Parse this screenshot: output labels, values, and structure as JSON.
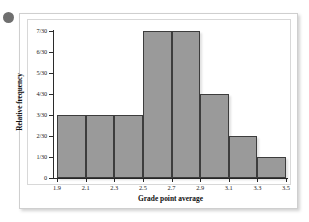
{
  "figure": {
    "bullet_marker": "bullet-dot",
    "frame_color": "#cfcfcf",
    "background_color": "#ffffff"
  },
  "chart_data": {
    "type": "bar",
    "title": "",
    "subtitle": "",
    "xlabel": "Grade point average",
    "ylabel": "Relative frequency",
    "grid": false,
    "legend": "none",
    "bar_fill_color": "#9a9a9a",
    "bar_border_color": "#3d3d3d",
    "axis_color": "#2b2b2b",
    "x_tick_labels": [
      "1.9",
      "2.1",
      "2.3",
      "2.5",
      "2.7",
      "2.9",
      "3.1",
      "3.3",
      "3.5"
    ],
    "x_tick_values": [
      1.9,
      2.1,
      2.3,
      2.5,
      2.7,
      2.9,
      3.1,
      3.3,
      3.5
    ],
    "xlim": [
      1.9,
      3.5
    ],
    "y_tick_labels": [
      "0",
      "1/30",
      "2/30",
      "3/30",
      "4/30",
      "5/30",
      "6/30",
      "7/30"
    ],
    "y_tick_values": [
      0,
      1,
      2,
      3,
      4,
      5,
      6,
      7
    ],
    "ylim": [
      0,
      7
    ],
    "y_denominator": 30,
    "bin_width": 0.2,
    "bin_edges": [
      1.9,
      2.1,
      2.3,
      2.5,
      2.7,
      2.9,
      3.1,
      3.3,
      3.5
    ],
    "categories": [
      "1.9-2.1",
      "2.1-2.3",
      "2.3-2.5",
      "2.5-2.7",
      "2.7-2.9",
      "2.9-3.1",
      "3.1-3.3",
      "3.3-3.5"
    ],
    "values": [
      3,
      3,
      3,
      7,
      7,
      4,
      2,
      1
    ],
    "value_labels": [
      "3/30",
      "3/30",
      "3/30",
      "7/30",
      "7/30",
      "4/30",
      "2/30",
      "1/30"
    ],
    "bars": [
      {
        "label": "1.9-2.1",
        "x0": 1.9,
        "x1": 2.1,
        "value": 3,
        "value_label": "3/30"
      },
      {
        "label": "2.1-2.3",
        "x0": 2.1,
        "x1": 2.3,
        "value": 3,
        "value_label": "3/30"
      },
      {
        "label": "2.3-2.5",
        "x0": 2.3,
        "x1": 2.5,
        "value": 3,
        "value_label": "3/30"
      },
      {
        "label": "2.5-2.7",
        "x0": 2.5,
        "x1": 2.7,
        "value": 7,
        "value_label": "7/30"
      },
      {
        "label": "2.7-2.9",
        "x0": 2.7,
        "x1": 2.9,
        "value": 7,
        "value_label": "7/30"
      },
      {
        "label": "2.9-3.1",
        "x0": 2.9,
        "x1": 3.1,
        "value": 4,
        "value_label": "4/30"
      },
      {
        "label": "3.1-3.3",
        "x0": 3.1,
        "x1": 3.3,
        "value": 2,
        "value_label": "2/30"
      },
      {
        "label": "3.3-3.5",
        "x0": 3.3,
        "x1": 3.5,
        "value": 1,
        "value_label": "1/30"
      }
    ]
  }
}
